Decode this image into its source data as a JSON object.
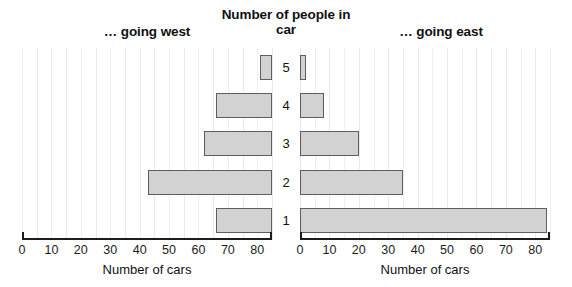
{
  "header": {
    "west_label": "… going west",
    "east_label": "… going east",
    "center_title": "Number of people in car"
  },
  "axis": {
    "west_title": "Number of cars",
    "east_title": "Number of cars",
    "west_ticks": [
      "80",
      "70",
      "60",
      "50",
      "40",
      "30",
      "20",
      "10",
      "0"
    ],
    "east_ticks": [
      "0",
      "10",
      "20",
      "30",
      "40",
      "50",
      "60",
      "70",
      "80"
    ]
  },
  "categories": [
    "5",
    "4",
    "3",
    "2",
    "1"
  ],
  "chart_data": {
    "type": "bar",
    "title": "Number of people in car",
    "orientation": "horizontal",
    "layout": "back-to-back pyramid",
    "categories": [
      "5",
      "4",
      "3",
      "2",
      "1"
    ],
    "category_order_top_to_bottom": [
      "5",
      "4",
      "3",
      "2",
      "1"
    ],
    "xlabel": "Number of cars",
    "ylabel": "Number of people in car",
    "xlim": [
      0,
      85
    ],
    "tick_step": 10,
    "minor_gridline_step": 5,
    "grid": true,
    "legend": "none",
    "series": [
      {
        "name": "… going west",
        "side": "left",
        "axis_direction": "right-to-left",
        "values": [
          4,
          19,
          23,
          42,
          19
        ]
      },
      {
        "name": "… going east",
        "side": "right",
        "axis_direction": "left-to-right",
        "values": [
          2,
          8,
          20,
          35,
          84
        ]
      }
    ],
    "colors": {
      "bar_fill": "#d2d2d2",
      "bar_border": "#5e5e5e",
      "gridline": "#efefef",
      "axis": "#1c1c1c",
      "background": "#ffffff"
    }
  }
}
